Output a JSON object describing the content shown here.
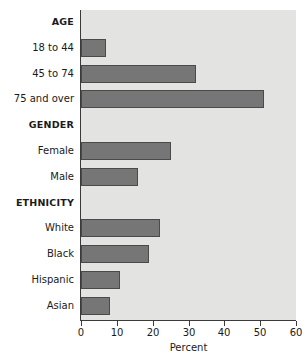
{
  "chart_data": {
    "type": "bar",
    "orientation": "horizontal",
    "title": "",
    "xlabel": "Percent",
    "ylabel": "",
    "xlim": [
      0,
      60
    ],
    "xticks": [
      0,
      10,
      20,
      30,
      40,
      50,
      60
    ],
    "grid": false,
    "legend": null,
    "bar_color": "#767676",
    "plot_background": "#e3e3e1",
    "groups": [
      {
        "name": "AGE",
        "categories": [
          "18 to 44",
          "45 to 74",
          "75 and over"
        ],
        "values": [
          7,
          32,
          51
        ]
      },
      {
        "name": "GENDER",
        "categories": [
          "Female",
          "Male"
        ],
        "values": [
          25,
          16
        ]
      },
      {
        "name": "ETHNICITY",
        "categories": [
          "White",
          "Black",
          "Hispanic",
          "Asian"
        ],
        "values": [
          22,
          19,
          11,
          8
        ]
      }
    ],
    "categories": [
      "18 to 44",
      "45 to 74",
      "75 and over",
      "Female",
      "Male",
      "White",
      "Black",
      "Hispanic",
      "Asian"
    ],
    "values": [
      7,
      32,
      51,
      25,
      16,
      22,
      19,
      11,
      8
    ]
  },
  "rows": [
    {
      "label": "AGE",
      "kind": "group"
    },
    {
      "label": "18 to 44",
      "kind": "bar",
      "value": 7
    },
    {
      "label": "45 to 74",
      "kind": "bar",
      "value": 32
    },
    {
      "label": "75 and over",
      "kind": "bar",
      "value": 51
    },
    {
      "label": "GENDER",
      "kind": "group"
    },
    {
      "label": "Female",
      "kind": "bar",
      "value": 25
    },
    {
      "label": "Male",
      "kind": "bar",
      "value": 16
    },
    {
      "label": "ETHNICITY",
      "kind": "group"
    },
    {
      "label": "White",
      "kind": "bar",
      "value": 22
    },
    {
      "label": "Black",
      "kind": "bar",
      "value": 19
    },
    {
      "label": "Hispanic",
      "kind": "bar",
      "value": 11
    },
    {
      "label": "Asian",
      "kind": "bar",
      "value": 8
    }
  ],
  "axis": {
    "title": "Percent",
    "ticks": [
      "0",
      "10",
      "20",
      "30",
      "40",
      "50",
      "60"
    ]
  }
}
